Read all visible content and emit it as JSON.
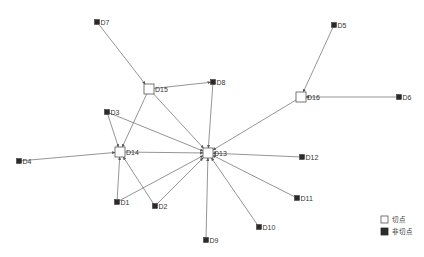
{
  "graph": {
    "nodes": [
      {
        "id": "D1",
        "label": "D1",
        "x": 117,
        "y": 202,
        "type": "non_cut"
      },
      {
        "id": "D2",
        "label": "D2",
        "x": 155,
        "y": 206,
        "type": "non_cut"
      },
      {
        "id": "D3",
        "label": "D3",
        "x": 107,
        "y": 112,
        "type": "non_cut"
      },
      {
        "id": "D4",
        "label": "D4",
        "x": 19,
        "y": 161,
        "type": "non_cut"
      },
      {
        "id": "D5",
        "label": "D5",
        "x": 334,
        "y": 25,
        "type": "non_cut"
      },
      {
        "id": "D6",
        "label": "D6",
        "x": 399,
        "y": 97,
        "type": "non_cut"
      },
      {
        "id": "D7",
        "label": "D7",
        "x": 97,
        "y": 22,
        "type": "non_cut"
      },
      {
        "id": "D8",
        "label": "D8",
        "x": 213,
        "y": 82,
        "type": "non_cut"
      },
      {
        "id": "D9",
        "label": "D9",
        "x": 206,
        "y": 240,
        "type": "non_cut"
      },
      {
        "id": "D10",
        "label": "D10",
        "x": 259,
        "y": 227,
        "type": "non_cut"
      },
      {
        "id": "D11",
        "label": "D11",
        "x": 297,
        "y": 198,
        "type": "non_cut"
      },
      {
        "id": "D12",
        "label": "D12",
        "x": 302,
        "y": 157,
        "type": "non_cut"
      },
      {
        "id": "D13",
        "label": "D13",
        "x": 208,
        "y": 153,
        "type": "cut"
      },
      {
        "id": "D14",
        "label": "D14",
        "x": 120,
        "y": 152,
        "type": "cut"
      },
      {
        "id": "D15",
        "label": "D15",
        "x": 149,
        "y": 89,
        "type": "cut"
      },
      {
        "id": "D16",
        "label": "D16",
        "x": 301,
        "y": 97,
        "type": "cut"
      }
    ],
    "edges": [
      [
        "D7",
        "D15"
      ],
      [
        "D15",
        "D8"
      ],
      [
        "D15",
        "D14"
      ],
      [
        "D15",
        "D13"
      ],
      [
        "D8",
        "D13"
      ],
      [
        "D3",
        "D14"
      ],
      [
        "D3",
        "D13"
      ],
      [
        "D4",
        "D14"
      ],
      [
        "D14",
        "D13"
      ],
      [
        "D1",
        "D14"
      ],
      [
        "D1",
        "D13"
      ],
      [
        "D2",
        "D14"
      ],
      [
        "D2",
        "D13"
      ],
      [
        "D9",
        "D13"
      ],
      [
        "D10",
        "D13"
      ],
      [
        "D11",
        "D13"
      ],
      [
        "D12",
        "D13"
      ],
      [
        "D16",
        "D13"
      ],
      [
        "D5",
        "D16"
      ],
      [
        "D6",
        "D16"
      ]
    ]
  },
  "legend": {
    "cut_label": "切点",
    "non_cut_label": "非切点"
  },
  "colors": {
    "edge": "#7a7a7a",
    "non_cut_fill": "#2b2b2b",
    "cut_fill": "#ffffff",
    "cut_stroke": "#555555",
    "label": "#333333"
  }
}
